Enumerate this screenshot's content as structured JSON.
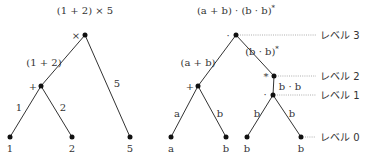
{
  "left_tree": {
    "title": "(1 + 2) × 5",
    "root_op": "×",
    "sub_label": "(1 + 2)",
    "inner_op": "+",
    "edge_labels": [
      "1",
      "2",
      "5"
    ],
    "leaves": [
      "1",
      "2",
      "5"
    ]
  },
  "right_tree": {
    "title": "(a + b) · (b · b)",
    "title_sup": "*",
    "root_op": "·",
    "left_sub_label": "(a + b)",
    "right_sub_label": "(b · b)",
    "right_sub_sup": "*",
    "plus_op": "+",
    "star_op": "*",
    "dot_op": "·",
    "dot_sub_label": "b · b",
    "edge_labels": [
      "a",
      "b",
      "b",
      "b"
    ],
    "leaves": [
      "a",
      "b",
      "b",
      "b"
    ]
  },
  "levels": [
    "レベル 3",
    "レベル 2",
    "レベル 1",
    "レベル 0"
  ],
  "colors": {
    "ink": "#333333",
    "node": "#111111",
    "level_line": "#999999"
  }
}
